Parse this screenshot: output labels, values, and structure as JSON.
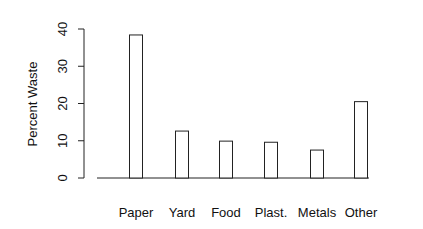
{
  "chart_data": {
    "type": "bar",
    "title": "",
    "xlabel": "",
    "ylabel": "Percent Waste",
    "categories": [
      "Paper",
      "Yard",
      "Food",
      "Plast.",
      "Metals",
      "Other"
    ],
    "values": [
      38.4,
      12.6,
      9.9,
      9.6,
      7.5,
      20.5
    ],
    "ylim": [
      0,
      40
    ],
    "yticks": [
      0,
      10,
      20,
      30,
      40
    ],
    "grid": false,
    "legend": null,
    "bar_fill": "#ffffff",
    "bar_stroke": "#222222"
  }
}
